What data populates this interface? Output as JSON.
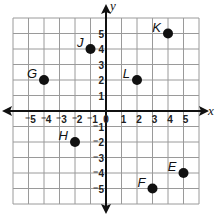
{
  "chart_data": {
    "type": "scatter",
    "title": "",
    "xlabel": "x",
    "ylabel": "y",
    "xlim": [
      -6,
      6
    ],
    "ylim": [
      -6,
      6
    ],
    "grid": true,
    "x_ticks": [
      "-5",
      "-4",
      "-3",
      "-2",
      "-1",
      "0",
      "1",
      "2",
      "3",
      "4",
      "5"
    ],
    "y_ticks": [
      "5",
      "4",
      "3",
      "2",
      "1",
      "-1",
      "-2",
      "-3",
      "-4",
      "-5"
    ],
    "points": [
      {
        "label": "G",
        "x": -4,
        "y": 2
      },
      {
        "label": "J",
        "x": -1,
        "y": 4
      },
      {
        "label": "K",
        "x": 4,
        "y": 5
      },
      {
        "label": "L",
        "x": 2,
        "y": 2
      },
      {
        "label": "H",
        "x": -2,
        "y": -2
      },
      {
        "label": "F",
        "x": 3,
        "y": -5
      },
      {
        "label": "E",
        "x": 5,
        "y": -4
      }
    ]
  },
  "colors": {
    "grid": "#9a9a9a",
    "axis": "#111111",
    "point": "#111111"
  }
}
